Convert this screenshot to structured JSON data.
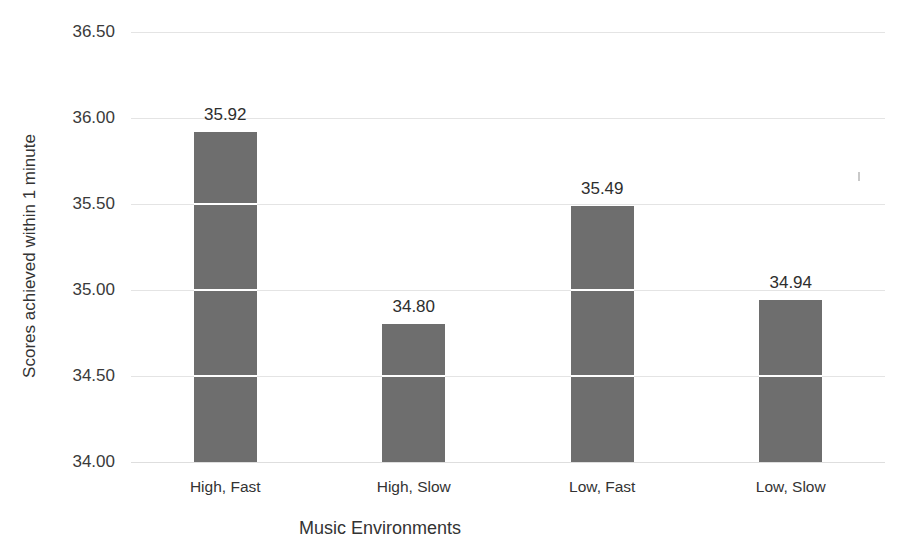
{
  "chart_data": {
    "type": "bar",
    "title": "",
    "title_note": "title is cropped off the top edge of the screenshot",
    "categories": [
      "High, Fast",
      "High, Slow",
      "Low, Fast",
      "Low, Slow"
    ],
    "values": [
      35.92,
      34.8,
      35.49,
      34.94
    ],
    "value_labels": [
      "35.92",
      "34.80",
      "35.49",
      "34.94"
    ],
    "xlabel": "Music  Environments",
    "ylabel": "Scores achieved within 1 minute",
    "ylim": [
      34.0,
      36.5
    ],
    "yticks": [
      36.5,
      36.0,
      35.5,
      35.0,
      34.5,
      34.0
    ],
    "ytick_labels": [
      "36.50",
      "36.00",
      "35.50",
      "35.00",
      "34.50",
      "34.00"
    ],
    "grid": true,
    "grid_axis": "y",
    "legend": false,
    "bar_color": "#6e6e6e",
    "gridline_color": "#e4e4e4",
    "background_color": "#ffffff"
  }
}
